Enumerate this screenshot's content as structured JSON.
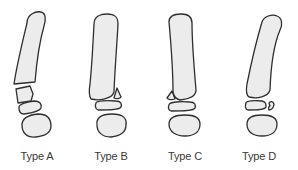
{
  "diagram": {
    "colors": {
      "bone_fill": "#ececec",
      "outline": "#2e2e2e",
      "label_text": "#3a3a3a",
      "background": "#ffffff"
    },
    "figures": [
      {
        "id": "A",
        "label": "Type A",
        "description": "transverse fracture through distal shaft with displaced fragment"
      },
      {
        "id": "B",
        "label": "Type B",
        "description": "small triangular avulsion fragment at distal lateral margin"
      },
      {
        "id": "C",
        "label": "Type C",
        "description": "small triangular avulsion fragment at distal medial margin"
      },
      {
        "id": "D",
        "label": "Type D",
        "description": "small chip fragment at lateral edge of middle segment"
      }
    ]
  }
}
